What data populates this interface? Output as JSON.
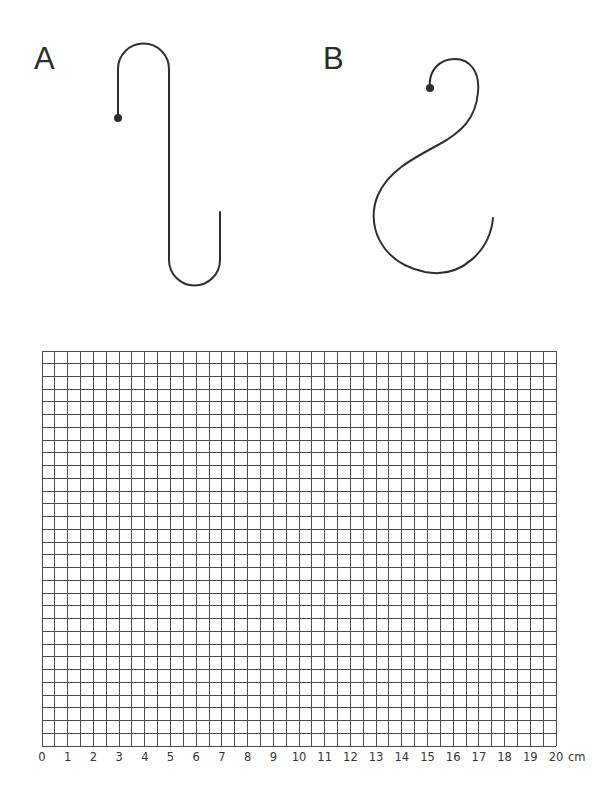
{
  "figures": {
    "a": {
      "label": "A"
    },
    "b": {
      "label": "B"
    }
  },
  "grid": {
    "columns": 40,
    "rows": 31,
    "line_color": "#4a4a4a",
    "axis": {
      "ticks": [
        "0",
        "1",
        "2",
        "3",
        "4",
        "5",
        "6",
        "7",
        "8",
        "9",
        "10",
        "11",
        "12",
        "13",
        "14",
        "15",
        "16",
        "17",
        "18",
        "19",
        "20"
      ],
      "unit": "cm"
    }
  },
  "colors": {
    "stroke": "#2e2e2e",
    "background": "#ffffff"
  }
}
